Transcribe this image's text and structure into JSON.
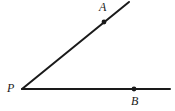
{
  "figure": {
    "kind": "geometry-angle-diagram",
    "background_color": "#ffffff",
    "stroke_color": "#1a1a1a",
    "canvas": {
      "width": 175,
      "height": 111
    },
    "labels": {
      "vertex": "P",
      "ray_upper_point": "A",
      "ray_lower_point": "B"
    },
    "points": [
      {
        "name": "P",
        "label": "P",
        "x": 22,
        "y": 89,
        "marked_dot": false
      },
      {
        "name": "A",
        "label": "A",
        "x": 104,
        "y": 22,
        "marked_dot": true
      },
      {
        "name": "B",
        "label": "B",
        "x": 134,
        "y": 89,
        "marked_dot": true
      }
    ],
    "rays": [
      {
        "name": "ray-PA",
        "from_x": 22,
        "from_y": 89,
        "to_x": 129,
        "to_y": 2,
        "stroke_width": 2
      },
      {
        "name": "ray-PB",
        "from_x": 22,
        "from_y": 89,
        "to_x": 170,
        "to_y": 89,
        "stroke_width": 2
      }
    ],
    "dot_radius": 2.4
  }
}
